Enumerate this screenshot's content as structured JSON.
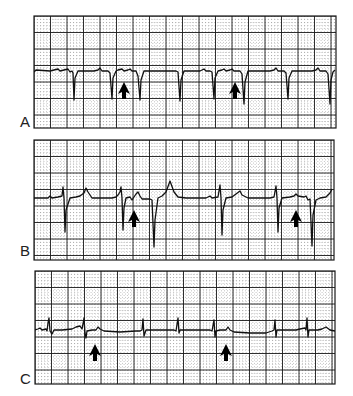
{
  "figure": {
    "panels": [
      {
        "label": "A",
        "label_pos": [
          20,
          114
        ],
        "box": [
          34,
          16,
          302,
          112
        ],
        "trace": "M34,72 L36,70 L50,71 L54,70 L58,69 L60,71 L64,70 L68,69 L70,72 L72,71 L73,73 L74,100 L75,78 L78,71 L94,71 L98,70 L100,68 L102,71 L108,71 L110,73 L112,99 L113,78 L116,71 L118,70 L122,69 L124,71 L128,70 L130,69 L132,71 L136,71 L138,76 L140,100 L141,80 L144,71 L160,71 L176,71 L178,72 L180,101 L181,80 L184,71 L200,71 L204,69 L206,71 L210,71 L212,72 L214,99 L215,78 L218,71 L222,70 L224,69 L226,71 L230,70 L232,69 L234,71 L240,71 L242,74 L244,104 L245,82 L248,71 L270,71 L274,70 L276,68 L278,71 L284,71 L286,73 L288,99 L289,78 L292,71 L312,71 L316,70 L318,68 L320,71 L326,71 L328,74 L330,104 L331,80 L333,72 L335,70",
        "arrows": [
          [
            124,
            82
          ],
          [
            235,
            82
          ]
        ]
      },
      {
        "label": "B",
        "label_pos": [
          20,
          243
        ],
        "box": [
          34,
          140,
          300,
          120
        ],
        "trace": "M34,198 L48,198 L50,196 L52,198 L58,197 L62,196 L63,187 L64,198 L65,232 L66,210 L70,198 L76,197 L80,196 L84,193 L86,188 L88,192 L92,198 L104,198 L112,198 L116,197 L118,195 L120,192 L121,187 L122,198 L123,230 L124,208 L126,198 L130,197 L132,200 L134,197 L136,194 L138,192 L140,196 L142,199 L150,199 L152,200 L154,247 L155,220 L158,198 L162,196 L166,192 L170,181 L174,192 L178,197 L186,198 L206,198 L208,197 L210,196 L212,198 L218,197 L220,185 L221,198 L222,235 L223,210 L226,198 L232,197 L236,194 L240,191 L242,195 L248,198 L256,198 L270,198 L274,197 L276,186 L277,198 L278,232 L279,208 L282,198 L290,197 L294,196 L296,194 L298,196 L304,197 L306,196 L308,200 L310,199 L312,246 L313,215 L316,200 L320,198 L326,197 L330,193 L332,189",
        "arrows": [
          [
            134,
            210
          ],
          [
            296,
            210
          ]
        ]
      },
      {
        "label": "C",
        "label_pos": [
          20,
          371
        ],
        "box": [
          35,
          271,
          300,
          113
        ],
        "trace": "M35,330 L38,329 L40,328 L42,330 L46,329 L47,331 L48,323 L49,318 L50,331 L52,334 L54,330 L62,330 L72,329 L76,327 L80,326 L82,329 L83,324 L84,318 L85,333 L86,338 L87,331 L92,330 L96,330 L98,327 L100,329 L104,331 L120,332 L136,331 L140,331 L142,330 L143,319 L144,336 L146,330 L160,330 L174,330 L176,331 L178,318 L179,333 L180,330 L200,330 L210,330 L212,331 L214,320 L215,337 L216,331 L220,330 L226,330 L228,327 L230,330 L234,332 L250,333 L266,333 L272,331 L274,330 L275,320 L276,337 L277,330 L296,330 L300,329 L305,328 L306,330 L307,318 L308,337 L309,330 L318,330 L322,329 L326,327 L330,330 L335,331",
        "arrows": [
          [
            95,
            344
          ],
          [
            226,
            344
          ]
        ]
      }
    ],
    "grid": {
      "major_step": 16.5,
      "minor_step": 3.3,
      "major_color": "#1a1a1a",
      "minor_color": "#8a8a8a",
      "trace_color": "#111111"
    }
  }
}
